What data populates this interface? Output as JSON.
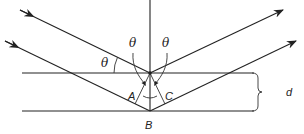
{
  "diagram": {
    "labels": {
      "theta_incident": "θ",
      "theta_left_normal": "θ",
      "theta_right_normal": "θ",
      "point_a": "A",
      "point_b": "B",
      "point_c": "C",
      "spacing": "d"
    },
    "colors": {
      "stroke": "#222222",
      "background": "#ffffff"
    },
    "geometry": {
      "plane_top_y": 73,
      "plane_bottom_y": 111,
      "plane_x_start": 22,
      "plane_x_end": 254,
      "normal_x": 150
    }
  }
}
